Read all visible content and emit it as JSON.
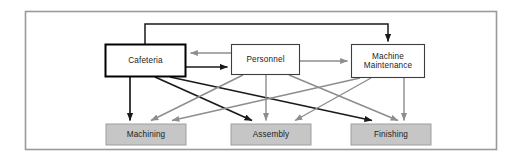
{
  "diagram": {
    "frame": {
      "border_color": "#9a9a9a",
      "background": "#ffffff",
      "x": 25,
      "y": 11,
      "width": 472,
      "height": 139
    },
    "colors": {
      "black_arrow": "#1a1a1a",
      "gray_arrow": "#8d8d8d",
      "service_box_border": "#3d3d3d",
      "highlight_box_border": "#000000",
      "operating_box_fill": "#c6c6c6",
      "operating_box_border": "#9e9e9e",
      "text": "#1c1c1c"
    },
    "service_departments": [
      {
        "id": "cafeteria",
        "label": "Cafeteria",
        "x": 105,
        "y": 44,
        "width": 81,
        "height": 33,
        "emphasized": true
      },
      {
        "id": "personnel",
        "label": "Personnel",
        "x": 231,
        "y": 44,
        "width": 69,
        "height": 31,
        "emphasized": false
      },
      {
        "id": "machine-maintenance",
        "label": "Machine\nMaintenance",
        "x": 351,
        "y": 44,
        "width": 74,
        "height": 34,
        "emphasized": false
      }
    ],
    "operating_departments": [
      {
        "id": "machining",
        "label": "Machining",
        "x": 106,
        "y": 124,
        "width": 80,
        "height": 21
      },
      {
        "id": "assembly",
        "label": "Assembly",
        "x": 231,
        "y": 124,
        "width": 80,
        "height": 21
      },
      {
        "id": "finishing",
        "label": "Finishing",
        "x": 351,
        "y": 124,
        "width": 80,
        "height": 21
      }
    ],
    "connections": [
      {
        "id": "cafeteria-to-machine-maintenance",
        "from": "cafeteria",
        "to": "machine-maintenance",
        "style": "black",
        "route": "orthogonal-top"
      },
      {
        "id": "personnel-to-cafeteria",
        "from": "personnel",
        "to": "cafeteria",
        "style": "gray",
        "route": "horizontal"
      },
      {
        "id": "cafeteria-to-personnel",
        "from": "cafeteria",
        "to": "personnel",
        "style": "black",
        "route": "horizontal"
      },
      {
        "id": "personnel-to-machine-maintenance",
        "from": "personnel",
        "to": "machine-maintenance",
        "style": "gray",
        "route": "horizontal"
      },
      {
        "id": "cafeteria-to-machining",
        "from": "cafeteria",
        "to": "machining",
        "style": "black",
        "route": "direct"
      },
      {
        "id": "cafeteria-to-assembly",
        "from": "cafeteria",
        "to": "assembly",
        "style": "black",
        "route": "direct"
      },
      {
        "id": "cafeteria-to-finishing",
        "from": "cafeteria",
        "to": "finishing",
        "style": "black",
        "route": "direct"
      },
      {
        "id": "personnel-to-machining",
        "from": "personnel",
        "to": "machining",
        "style": "gray",
        "route": "direct"
      },
      {
        "id": "personnel-to-assembly",
        "from": "personnel",
        "to": "assembly",
        "style": "gray",
        "route": "direct"
      },
      {
        "id": "personnel-to-finishing",
        "from": "personnel",
        "to": "finishing",
        "style": "gray",
        "route": "direct"
      },
      {
        "id": "machine-maintenance-to-machining",
        "from": "machine-maintenance",
        "to": "machining",
        "style": "gray",
        "route": "direct"
      },
      {
        "id": "machine-maintenance-to-assembly",
        "from": "machine-maintenance",
        "to": "assembly",
        "style": "gray",
        "route": "direct"
      },
      {
        "id": "machine-maintenance-to-finishing",
        "from": "machine-maintenance",
        "to": "finishing",
        "style": "gray",
        "route": "direct"
      }
    ]
  }
}
